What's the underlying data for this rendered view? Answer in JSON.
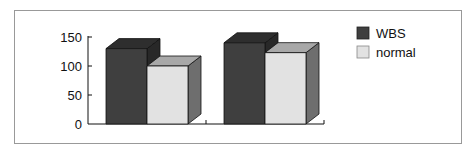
{
  "chart_data": {
    "type": "bar",
    "style": "3d-clustered",
    "title": "",
    "xlabel": "",
    "ylabel": "",
    "categories": [
      "",
      ""
    ],
    "series": [
      {
        "name": "WBS",
        "values": [
          130,
          140
        ],
        "color": "#3f3f3f"
      },
      {
        "name": "normal",
        "values": [
          100,
          123
        ],
        "color": "#e2e2e2"
      }
    ],
    "ylim": [
      0,
      150
    ],
    "yticks": [
      0,
      50,
      100,
      150
    ],
    "grid": false,
    "legend_position": "right"
  },
  "legend": {
    "items": [
      {
        "label": "WBS"
      },
      {
        "label": "normal"
      }
    ]
  },
  "axis": {
    "ticks": [
      "0",
      "50",
      "100",
      "150"
    ]
  }
}
